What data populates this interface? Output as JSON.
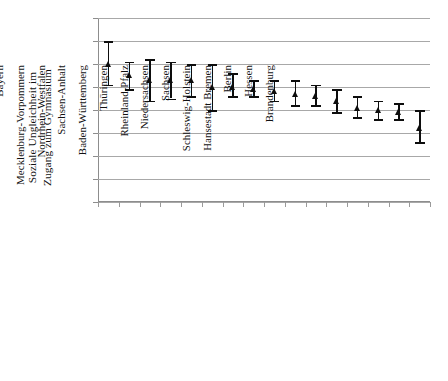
{
  "chart_data": {
    "type": "scatter",
    "title": "",
    "xlabel": "",
    "ylabel": "Soziale Ungleichheit im Zugang zum Gymnasium",
    "ylabel_lines": [
      "Soziale Ungleichheit im",
      "Zugang zum Gymnasium"
    ],
    "ylim": [
      0,
      0.08
    ],
    "ytick_values": [
      0,
      0.01,
      0.02,
      0.03,
      0.04,
      0.05,
      0.06,
      0.07,
      0.08
    ],
    "ytick_labels": [
      "0",
      "0,01",
      "0,02",
      "0,03",
      "0,04",
      "0,05",
      "0,06",
      "0,07",
      "0,08"
    ],
    "grid": true,
    "legend": "none",
    "error_bars": "confidence interval",
    "marker": "triangle",
    "categories": [
      "Saarland",
      "Hansestadt Hamburg",
      "Bayern",
      "Mecklenburg-Vorpommern",
      "Nordrhein-Westfalen",
      "Sachsen-Anhalt",
      "Baden-Württemberg",
      "Thüringen",
      "Rheinland-Pfalz",
      "Niedersachsen",
      "Sachsen",
      "Schleswig-Holstein",
      "Hansestadt Bremen",
      "Berlin",
      "Hessen",
      "Brandenburg"
    ],
    "values": [
      0.06,
      0.055,
      0.053,
      0.053,
      0.053,
      0.05,
      0.05,
      0.049,
      0.048,
      0.047,
      0.046,
      0.044,
      0.041,
      0.04,
      0.039,
      0.032
    ],
    "ci_lower": [
      0.051,
      0.049,
      0.044,
      0.045,
      0.046,
      0.04,
      0.046,
      0.046,
      0.044,
      0.042,
      0.042,
      0.039,
      0.037,
      0.036,
      0.036,
      0.026
    ],
    "ci_upper": [
      0.07,
      0.061,
      0.062,
      0.061,
      0.06,
      0.06,
      0.056,
      0.053,
      0.053,
      0.053,
      0.051,
      0.049,
      0.046,
      0.044,
      0.043,
      0.04
    ]
  },
  "colors": {
    "marker": "#0d0d0d",
    "grid": "#a8a8a8",
    "axis": "#8d8d8d",
    "background": "#ffffff",
    "text": "#111111"
  }
}
